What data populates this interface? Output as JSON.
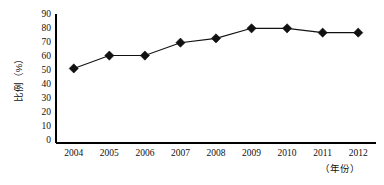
{
  "chart_data": {
    "type": "line",
    "title": "",
    "subtitle": "",
    "xlabel": "（年份）",
    "ylabel": "比例（%）",
    "categories": [
      "2004",
      "2005",
      "2006",
      "2007",
      "2008",
      "2009",
      "2010",
      "2011",
      "2012"
    ],
    "values": [
      52,
      61,
      61,
      70,
      73,
      80,
      80,
      77,
      77
    ],
    "series": [
      {
        "name": "比例",
        "values": [
          52,
          61,
          61,
          70,
          73,
          80,
          80,
          77,
          77
        ]
      }
    ],
    "ylim": [
      0,
      90
    ],
    "ytick_labels": [
      "0",
      "10",
      "20",
      "30",
      "40",
      "50",
      "60",
      "70",
      "80",
      "90"
    ],
    "ytick_values": [
      0,
      10,
      20,
      30,
      40,
      50,
      60,
      70,
      80,
      90
    ],
    "xtick_labels": [
      "2004",
      "2005",
      "2006",
      "2007",
      "2008",
      "2009",
      "2010",
      "2011",
      "2012"
    ],
    "grid": false,
    "legend": false,
    "legend_position": "none",
    "marker": "diamond",
    "line_color": "#111111",
    "marker_color": "#111111",
    "background_color": "#ffffff",
    "axis_color": "#000000"
  },
  "axis_titles": {
    "y": "比例（%）",
    "x": "（年份）"
  }
}
